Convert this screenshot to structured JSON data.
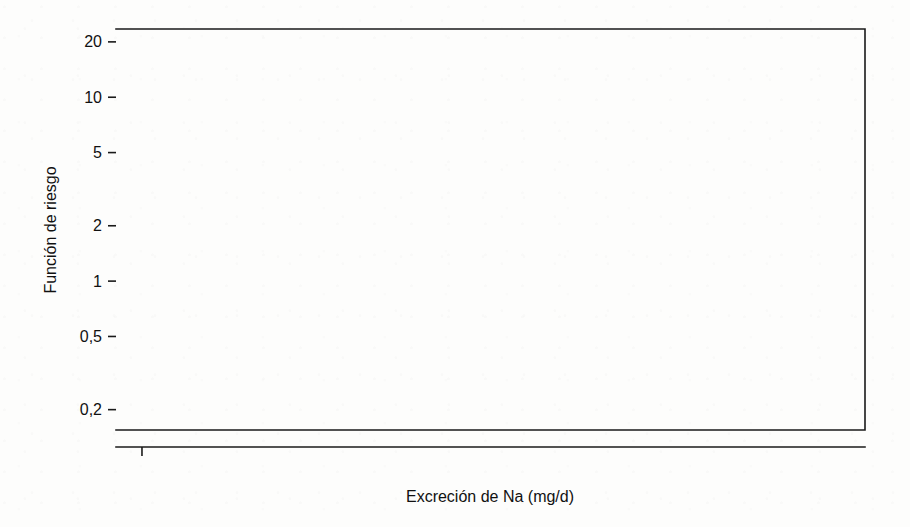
{
  "figure": {
    "background_color": "#fdfdfc",
    "ink_color": "#1a1a1a"
  },
  "axes": {
    "y_title": "Función de riesgo",
    "x_title": "Excreción de Na (mg/d)",
    "y_tick_labels": [
      "20",
      "10",
      "5",
      "2",
      "1",
      "0,5",
      "0,2"
    ],
    "x_tick_labels": [
      "1000",
      "2000",
      "3000",
      "4000",
      "5000",
      "6000",
      "7000",
      "8000",
      "9000"
    ]
  },
  "chart_data": {
    "type": "line",
    "title": "",
    "xlabel": "Excreción de Na (mg/d)",
    "ylabel": "Función de riesgo",
    "xlim": [
      700,
      9350
    ],
    "ylim": [
      0.155,
      23.5
    ],
    "yscale": "log",
    "xscale": "linear",
    "grid": false,
    "legend": "none",
    "y_ticks": [
      20,
      10,
      5,
      2,
      1,
      0.5,
      0.2
    ],
    "y_tick_labels": [
      "20",
      "10",
      "5",
      "2",
      "1",
      "0,5",
      "0,2"
    ],
    "x_ticks": [
      1000,
      2000,
      3000,
      4000,
      5000,
      6000,
      7000,
      8000,
      9000
    ],
    "x_minor_ticks": [
      1500,
      2500,
      3500,
      4500,
      5500,
      6500,
      7500,
      8500
    ],
    "x": [
      1080,
      1300,
      1500,
      1750,
      2000,
      2250,
      2500,
      2750,
      3000,
      3250,
      3500,
      3750,
      4000,
      4250,
      4500,
      4750,
      5000,
      5250,
      5500,
      5750,
      6000,
      6250,
      6500,
      6750,
      7000,
      7250,
      7500,
      7750,
      8000,
      8250,
      8500,
      8750,
      9000,
      9250,
      9330
    ],
    "series": [
      {
        "name": "Estimación puntual",
        "style": "dashed",
        "values": [
          0.67,
          0.7,
          0.73,
          0.76,
          0.79,
          0.82,
          0.85,
          0.88,
          0.91,
          0.94,
          0.97,
          1.0,
          1.03,
          1.06,
          1.08,
          1.1,
          1.11,
          1.12,
          1.13,
          1.14,
          1.15,
          1.17,
          1.22,
          1.31,
          1.44,
          1.6,
          1.78,
          1.98,
          2.2,
          2.44,
          2.7,
          2.98,
          3.26,
          3.55,
          3.65
        ]
      },
      {
        "name": "Límite superior IC 95%",
        "style": "dotted",
        "values": [
          2.1,
          1.72,
          1.48,
          1.3,
          1.19,
          1.12,
          1.08,
          1.07,
          1.07,
          1.09,
          1.11,
          1.14,
          1.18,
          1.22,
          1.27,
          1.33,
          1.4,
          1.48,
          1.58,
          1.7,
          1.84,
          2.02,
          2.26,
          2.58,
          3.0,
          3.52,
          4.16,
          4.95,
          5.9,
          7.05,
          8.45,
          10.2,
          12.4,
          16.5,
          19.3
        ]
      },
      {
        "name": "Límite inferior IC 95%",
        "style": "dotted",
        "values": [
          0.198,
          0.25,
          0.305,
          0.37,
          0.43,
          0.485,
          0.535,
          0.58,
          0.62,
          0.655,
          0.69,
          0.72,
          0.75,
          0.775,
          0.8,
          0.82,
          0.84,
          0.85,
          0.855,
          0.85,
          0.835,
          0.815,
          0.795,
          0.785,
          0.782,
          0.788,
          0.8,
          0.818,
          0.84,
          0.87,
          0.905,
          0.95,
          0.96,
          0.94,
          0.92
        ]
      }
    ],
    "rug": {
      "name": "Distribución marginal de observaciones",
      "position": "bottom",
      "values": [
        1020,
        1080,
        1110,
        1140,
        1190,
        1250,
        1290,
        1320,
        1360,
        1400,
        1430,
        1460,
        1480,
        1500,
        1520,
        1545,
        1560,
        1580,
        1600,
        1620,
        1640,
        1660,
        1680,
        1700,
        1720,
        1740,
        1760,
        1780,
        1800,
        1815,
        1830,
        1850,
        1870,
        1890,
        1910,
        1930,
        1950,
        1970,
        1990,
        2010,
        2030,
        2050,
        2070,
        2090,
        2110,
        2130,
        2150,
        2170,
        2190,
        2210,
        2230,
        2250,
        2270,
        2290,
        2310,
        2330,
        2350,
        2370,
        2390,
        2410,
        2430,
        2450,
        2470,
        2490,
        2510,
        2530,
        2550,
        2570,
        2590,
        2610,
        2630,
        2650,
        2670,
        2690,
        2710,
        2730,
        2750,
        2770,
        2790,
        2810,
        2830,
        2850,
        2870,
        2890,
        2910,
        2930,
        2950,
        2970,
        2990,
        3010,
        3030,
        3050,
        3070,
        3090,
        3110,
        3130,
        3150,
        3170,
        3190,
        3210,
        3230,
        3250,
        3270,
        3290,
        3310,
        3330,
        3350,
        3370,
        3390,
        3410,
        3430,
        3450,
        3470,
        3490,
        3510,
        3530,
        3550,
        3570,
        3590,
        3610,
        3630,
        3650,
        3670,
        3690,
        3710,
        3730,
        3750,
        3770,
        3790,
        3810,
        3830,
        3850,
        3870,
        3890,
        3910,
        3930,
        3950,
        3970,
        3990,
        4010,
        4030,
        4050,
        4070,
        4090,
        4110,
        4130,
        4150,
        4170,
        4190,
        4210,
        4230,
        4250,
        4270,
        4290,
        4310,
        4330,
        4350,
        4370,
        4390,
        4410,
        4430,
        4450,
        4470,
        4490,
        4510,
        4530,
        4550,
        4570,
        4590,
        4610,
        4630,
        4650,
        4670,
        4690,
        4710,
        4730,
        4750,
        4770,
        4790,
        4810,
        4830,
        4850,
        4870,
        4890,
        4910,
        4930,
        4950,
        4970,
        4990,
        5010,
        5030,
        5050,
        5070,
        5090,
        5110,
        5130,
        5150,
        5170,
        5190,
        5210,
        5230,
        5250,
        5270,
        5290,
        5310,
        5330,
        5350,
        5370,
        5390,
        5410,
        5430,
        5450,
        5470,
        5490,
        5510,
        5530,
        5550,
        5570,
        5590,
        5610,
        5630,
        5650,
        5670,
        5690,
        5710,
        5730,
        5750,
        5770,
        5790,
        5810,
        5830,
        5850,
        5870,
        5890,
        5910,
        5930,
        5950,
        5970,
        5990,
        6010,
        6030,
        6050,
        6070,
        6090,
        6110,
        6130,
        6150,
        6175,
        6200,
        6225,
        6250,
        6275,
        6300,
        6325,
        6350,
        6375,
        6400,
        6425,
        6450,
        6480,
        6510,
        6540,
        6570,
        6600,
        6630,
        6660,
        6690,
        6720,
        6750,
        6790,
        6830,
        6870,
        6900,
        6940,
        6980,
        7020,
        7060,
        7100,
        7140,
        7180,
        7230,
        7280,
        7330,
        7380,
        7430,
        7480,
        7530,
        7600,
        7660,
        7720,
        7790,
        7860,
        7930,
        8000,
        8080,
        8160,
        8250,
        8340,
        8430,
        8520,
        8620,
        8720,
        8830,
        8950,
        9080,
        9200,
        9310
      ]
    }
  }
}
